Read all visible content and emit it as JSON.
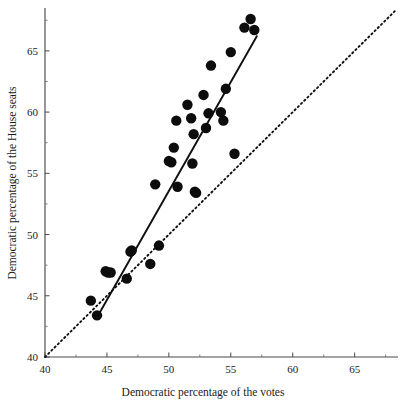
{
  "figure": {
    "background_color": "#ffffff",
    "point_color": "#0d0d0d",
    "line_color": "#101010",
    "axis_color": "#4a4a4a"
  },
  "chart_data": {
    "type": "scatter",
    "title": "",
    "subtitle": "",
    "xlabel": "Democratic percentage of the votes",
    "ylabel": "Democratic percentage of the House seats",
    "xlim": [
      40,
      68.5
    ],
    "ylim": [
      40,
      68.5
    ],
    "xticks": [
      40,
      45,
      50,
      55,
      60,
      65
    ],
    "yticks": [
      40,
      45,
      50,
      55,
      60,
      65
    ],
    "xtick_labels": [
      "40",
      "45",
      "50",
      "55",
      "60",
      "65"
    ],
    "ytick_labels": [
      "40",
      "45",
      "50",
      "55",
      "60",
      "65"
    ],
    "xminor_ticks": [
      42.5,
      47.5,
      52.5,
      57.5,
      62.5,
      67.5
    ],
    "yminor_ticks": [
      42.5,
      47.5,
      52.5,
      57.5,
      62.5,
      67.5
    ],
    "grid": false,
    "legend": null,
    "series": [
      {
        "name": "Elections",
        "type": "scatter",
        "marker": "filled-circle",
        "marker_size": 5.2,
        "points": [
          {
            "x": 43.7,
            "y": 44.6
          },
          {
            "x": 44.2,
            "y": 43.4
          },
          {
            "x": 44.9,
            "y": 47.0
          },
          {
            "x": 45.1,
            "y": 46.9
          },
          {
            "x": 45.3,
            "y": 46.9
          },
          {
            "x": 46.6,
            "y": 46.4
          },
          {
            "x": 46.9,
            "y": 48.6
          },
          {
            "x": 47.0,
            "y": 48.7
          },
          {
            "x": 48.5,
            "y": 47.6
          },
          {
            "x": 48.9,
            "y": 54.1
          },
          {
            "x": 49.2,
            "y": 49.1
          },
          {
            "x": 50.0,
            "y": 56.0
          },
          {
            "x": 50.2,
            "y": 55.9
          },
          {
            "x": 50.4,
            "y": 57.1
          },
          {
            "x": 50.6,
            "y": 59.3
          },
          {
            "x": 50.7,
            "y": 53.9
          },
          {
            "x": 51.5,
            "y": 60.6
          },
          {
            "x": 51.8,
            "y": 59.5
          },
          {
            "x": 51.9,
            "y": 55.8
          },
          {
            "x": 52.0,
            "y": 58.2
          },
          {
            "x": 52.1,
            "y": 53.5
          },
          {
            "x": 52.2,
            "y": 53.4
          },
          {
            "x": 52.8,
            "y": 61.4
          },
          {
            "x": 53.0,
            "y": 58.7
          },
          {
            "x": 53.2,
            "y": 59.9
          },
          {
            "x": 53.4,
            "y": 63.8
          },
          {
            "x": 54.2,
            "y": 60.0
          },
          {
            "x": 54.4,
            "y": 59.3
          },
          {
            "x": 54.6,
            "y": 61.9
          },
          {
            "x": 55.0,
            "y": 64.9
          },
          {
            "x": 55.3,
            "y": 56.6
          },
          {
            "x": 56.1,
            "y": 66.9
          },
          {
            "x": 56.6,
            "y": 67.6
          },
          {
            "x": 56.9,
            "y": 66.7
          }
        ]
      },
      {
        "name": "Fitted regression line",
        "type": "line",
        "style": "solid",
        "x_start": 44.4,
        "y_start": 43.6,
        "x_end": 57.1,
        "y_end": 66.2
      },
      {
        "name": "Proportionality reference line",
        "type": "line",
        "style": "dotted",
        "x_start": 40.0,
        "y_start": 40.0,
        "x_end": 68.4,
        "y_end": 68.4
      }
    ]
  }
}
